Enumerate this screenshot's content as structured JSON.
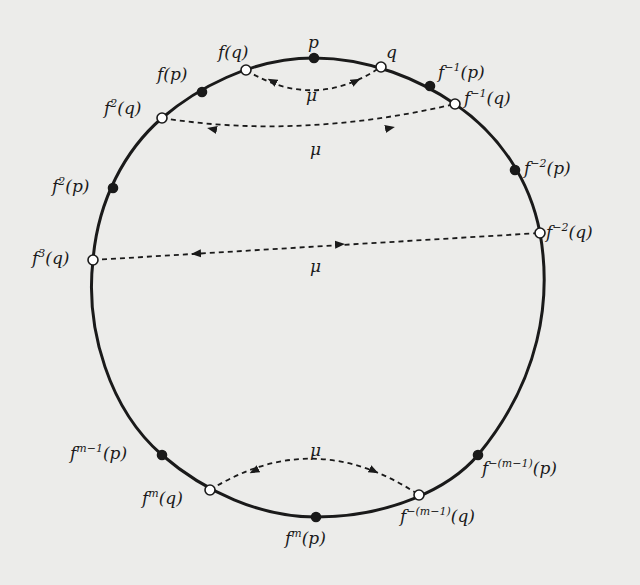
{
  "figure": {
    "type": "orbit-diagram",
    "curve": "closed loop (circle-like)",
    "pair_label": "μ",
    "colors": {
      "curve": "#1a1a1a",
      "background": "#ececea"
    }
  },
  "points": [
    {
      "id": "p",
      "base": "",
      "exp": "",
      "arg": "p",
      "kind": "filled",
      "x": 314,
      "y": 58
    },
    {
      "id": "q",
      "base": "",
      "exp": "",
      "arg": "q",
      "kind": "open",
      "x": 381,
      "y": 67
    },
    {
      "id": "fq",
      "base": "f",
      "exp": "",
      "arg": "(q)",
      "kind": "open",
      "x": 246,
      "y": 70
    },
    {
      "id": "fp",
      "base": "f",
      "exp": "",
      "arg": "(p)",
      "kind": "filled",
      "x": 202,
      "y": 92
    },
    {
      "id": "finv1p",
      "base": "f",
      "exp": "−1",
      "arg": "(p)",
      "kind": "filled",
      "x": 430,
      "y": 86
    },
    {
      "id": "finv1q",
      "base": "f",
      "exp": "−1",
      "arg": "(q)",
      "kind": "open",
      "x": 455,
      "y": 104
    },
    {
      "id": "f2q",
      "base": "f",
      "exp": "2",
      "arg": "(q)",
      "kind": "open",
      "x": 162,
      "y": 118
    },
    {
      "id": "f2p",
      "base": "f",
      "exp": "2",
      "arg": "(p)",
      "kind": "filled",
      "x": 113,
      "y": 188
    },
    {
      "id": "f3q",
      "base": "f",
      "exp": "3",
      "arg": "(q)",
      "kind": "open",
      "x": 93,
      "y": 260
    },
    {
      "id": "finv2p",
      "base": "f",
      "exp": "−2",
      "arg": "(p)",
      "kind": "filled",
      "x": 515,
      "y": 170
    },
    {
      "id": "finv2q",
      "base": "f",
      "exp": "−2",
      "arg": "(q)",
      "kind": "open",
      "x": 540,
      "y": 233
    },
    {
      "id": "fm1p",
      "base": "f",
      "exp": "m−1",
      "arg": "(p)",
      "kind": "filled",
      "x": 162,
      "y": 455
    },
    {
      "id": "fmq",
      "base": "f",
      "exp": "m",
      "arg": "(q)",
      "kind": "open",
      "x": 210,
      "y": 490
    },
    {
      "id": "fmp",
      "base": "f",
      "exp": "m",
      "arg": "(p)",
      "kind": "filled",
      "x": 316,
      "y": 517
    },
    {
      "id": "finvm1q",
      "base": "f",
      "exp": "−(m−1)",
      "arg": "(q)",
      "kind": "open",
      "x": 419,
      "y": 495
    },
    {
      "id": "finvm1p",
      "base": "f",
      "exp": "−(m−1)",
      "arg": "(p)",
      "kind": "filled",
      "x": 478,
      "y": 455
    }
  ],
  "pairings": [
    {
      "from": "fq",
      "to": "q",
      "label": "μ"
    },
    {
      "from": "f2q",
      "to": "finv1q",
      "label": "μ"
    },
    {
      "from": "f3q",
      "to": "finv2q",
      "label": "μ"
    },
    {
      "from": "fmq",
      "to": "finvm1q",
      "label": "μ"
    }
  ]
}
